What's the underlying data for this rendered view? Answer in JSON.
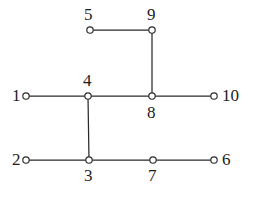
{
  "figure": {
    "type": "node-link-graph",
    "background_color": "#ffffff",
    "stroke_color": "#2a2a2a",
    "node_fill_color": "#ffffff",
    "node_radius": 3.2,
    "width": 253,
    "height": 199
  },
  "nodes": [
    {
      "id": "1",
      "label": "1",
      "x": 26,
      "y": 96,
      "label_x": 12,
      "label_y": 87,
      "label_position": "left"
    },
    {
      "id": "2",
      "label": "2",
      "x": 26,
      "y": 160,
      "label_x": 12,
      "label_y": 151,
      "label_position": "left"
    },
    {
      "id": "3",
      "label": "3",
      "x": 89,
      "y": 160,
      "label_x": 84,
      "label_y": 167,
      "label_position": "below"
    },
    {
      "id": "4",
      "label": "4",
      "x": 88,
      "y": 96,
      "label_x": 83,
      "label_y": 72,
      "label_position": "above"
    },
    {
      "id": "5",
      "label": "5",
      "x": 90,
      "y": 30,
      "label_x": 84,
      "label_y": 6,
      "label_position": "above"
    },
    {
      "id": "6",
      "label": "6",
      "x": 214,
      "y": 160,
      "label_x": 222,
      "label_y": 151,
      "label_position": "right"
    },
    {
      "id": "7",
      "label": "7",
      "x": 153,
      "y": 160,
      "label_x": 148,
      "label_y": 167,
      "label_position": "below"
    },
    {
      "id": "8",
      "label": "8",
      "x": 152,
      "y": 96,
      "label_x": 147,
      "label_y": 104,
      "label_position": "below"
    },
    {
      "id": "9",
      "label": "9",
      "x": 152,
      "y": 30,
      "label_x": 147,
      "label_y": 6,
      "label_position": "above"
    },
    {
      "id": "10",
      "label": "10",
      "x": 214,
      "y": 96,
      "label_x": 222,
      "label_y": 87,
      "label_position": "right"
    }
  ],
  "edges": [
    {
      "from": "5",
      "to": "9"
    },
    {
      "from": "9",
      "to": "8"
    },
    {
      "from": "1",
      "to": "4"
    },
    {
      "from": "4",
      "to": "8"
    },
    {
      "from": "8",
      "to": "10"
    },
    {
      "from": "4",
      "to": "3"
    },
    {
      "from": "2",
      "to": "3"
    },
    {
      "from": "3",
      "to": "7"
    },
    {
      "from": "7",
      "to": "6"
    }
  ]
}
